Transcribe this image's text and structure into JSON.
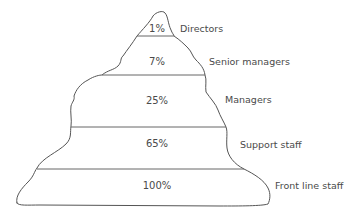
{
  "diagram": {
    "type": "organisational-pyramid",
    "levels": [
      {
        "name": "Directors",
        "percentage": "1%"
      },
      {
        "name": "Senior managers",
        "percentage": "7%"
      },
      {
        "name": "Managers",
        "percentage": "25%"
      },
      {
        "name": "Support staff",
        "percentage": "65%"
      },
      {
        "name": "Front line staff",
        "percentage": "100%"
      }
    ]
  }
}
